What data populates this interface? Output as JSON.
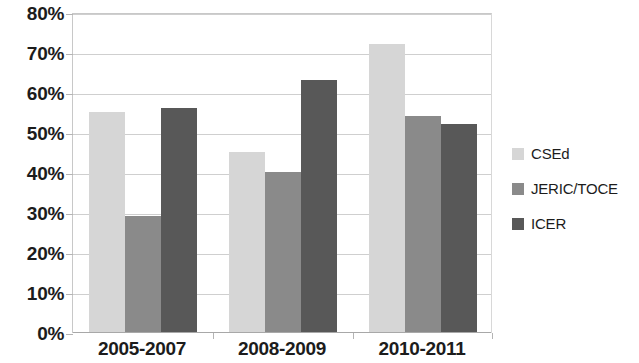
{
  "chart_data": {
    "type": "bar",
    "title": "",
    "xlabel": "",
    "ylabel": "",
    "categories": [
      "2005-2007",
      "2008-2009",
      "2010-2011"
    ],
    "series": [
      {
        "name": "CSEd",
        "color": "#d6d6d6",
        "values": [
          55,
          45,
          72
        ]
      },
      {
        "name": "JERIC/TOCE",
        "color": "#8a8a8a",
        "values": [
          29,
          40,
          54
        ]
      },
      {
        "name": "ICER",
        "color": "#585858",
        "values": [
          56,
          63,
          52
        ]
      }
    ],
    "ylim": [
      0,
      80
    ],
    "ytick_labels": [
      "80%",
      "70%",
      "60%",
      "50%",
      "40%",
      "30%",
      "20%",
      "10%",
      "0%"
    ],
    "ytick_values": [
      80,
      70,
      60,
      50,
      40,
      30,
      20,
      10,
      0
    ],
    "grid": true,
    "legend_position": "right"
  }
}
